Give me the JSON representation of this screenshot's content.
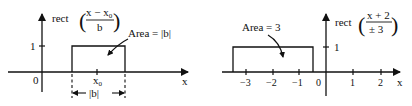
{
  "left_plot": {
    "ylabel": "rect",
    "formula_numerator": "x − x",
    "formula_numerator_sub": "0",
    "formula_denominator": "b",
    "y_tick": "1",
    "origin": "0",
    "x_center": "x",
    "x_center_sub": "0",
    "xlabel": "x",
    "annotation": "Area = |b|",
    "width_label": "|b|"
  },
  "right_plot": {
    "ylabel": "rect",
    "formula_numerator": "x + 2",
    "formula_denominator": "± 3",
    "y_tick": "1",
    "origin": "0",
    "xlabel": "x",
    "annotation": "Area = 3",
    "x_ticks": [
      "−3",
      "−2",
      "−1",
      "1",
      "2"
    ]
  }
}
